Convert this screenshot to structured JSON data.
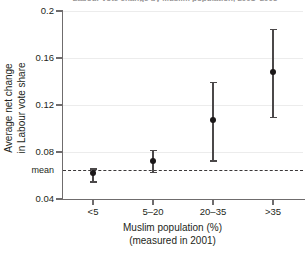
{
  "chart_data": {
    "type": "scatter",
    "title": "Labour vote change by Muslim population, 2001–2005",
    "xlabel": "Muslim population (%)",
    "xlabel_sub": "(measured in 2001)",
    "ylabel": "Average net change",
    "ylabel_sub": "in Labour vote share",
    "categories": [
      "<5",
      "5–20",
      "20–35",
      ">35"
    ],
    "values": [
      0.062,
      0.072,
      0.107,
      0.148
    ],
    "error_low": [
      0.055,
      0.063,
      0.073,
      0.11
    ],
    "error_high": [
      0.066,
      0.082,
      0.14,
      0.185
    ],
    "ylim": [
      0.04,
      0.2
    ],
    "yticks": [
      "0.04",
      "0.08",
      "0.12",
      "0.16",
      "0.2"
    ],
    "ytick_values": [
      0.04,
      0.08,
      0.12,
      0.16,
      0.2
    ],
    "mean_label": "mean",
    "mean_value": 0.0647,
    "grid": true,
    "legend": "none",
    "colors": {
      "marker": "#1a1718",
      "whisker": "#4b4849",
      "grid": "#ececec",
      "axis": "#6f6c6d",
      "mean": "#3b3839",
      "text": "#231f20"
    }
  }
}
